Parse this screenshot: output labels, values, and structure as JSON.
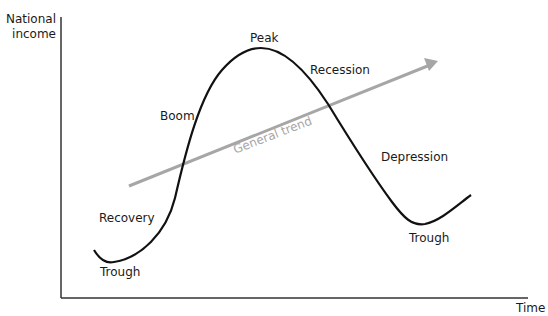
{
  "axes": {
    "y_label_line1": "National",
    "y_label_line2": "income",
    "x_label": "Time"
  },
  "phases": {
    "trough_left": "Trough",
    "recovery": "Recovery",
    "boom": "Boom",
    "peak": "Peak",
    "recession": "Recession",
    "depression": "Depression",
    "trough_right": "Trough"
  },
  "trend": {
    "label": "General trend",
    "color": "#a6a6a6"
  },
  "colors": {
    "curve": "#111111",
    "axis": "#333333",
    "text": "#1a1a1a"
  }
}
